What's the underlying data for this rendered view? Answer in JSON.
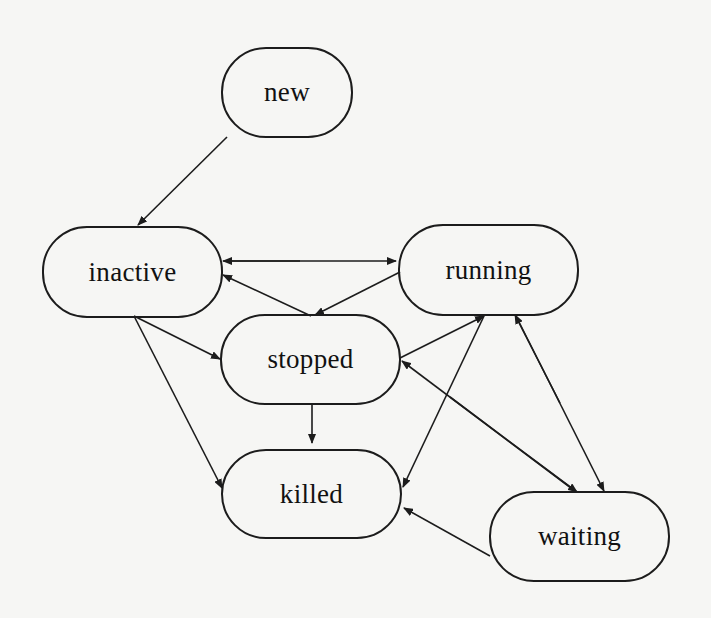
{
  "diagram": {
    "type": "state-transition-diagram",
    "nodes": [
      {
        "id": "new",
        "label": "new"
      },
      {
        "id": "inactive",
        "label": "inactive"
      },
      {
        "id": "running",
        "label": "running"
      },
      {
        "id": "stopped",
        "label": "stopped"
      },
      {
        "id": "killed",
        "label": "killed"
      },
      {
        "id": "waiting",
        "label": "waiting"
      }
    ],
    "edges": [
      {
        "from": "new",
        "to": "inactive"
      },
      {
        "from": "inactive",
        "to": "running"
      },
      {
        "from": "running",
        "to": "inactive"
      },
      {
        "from": "stopped",
        "to": "inactive"
      },
      {
        "from": "inactive",
        "to": "stopped"
      },
      {
        "from": "inactive",
        "to": "killed"
      },
      {
        "from": "running",
        "to": "stopped"
      },
      {
        "from": "stopped",
        "to": "running"
      },
      {
        "from": "stopped",
        "to": "killed"
      },
      {
        "from": "running",
        "to": "killed"
      },
      {
        "from": "running",
        "to": "waiting"
      },
      {
        "from": "waiting",
        "to": "running"
      },
      {
        "from": "waiting",
        "to": "stopped"
      },
      {
        "from": "waiting",
        "to": "killed"
      }
    ],
    "colors": {
      "stroke": "#1c1c1c",
      "text": "#111111",
      "background": "#f6f6f4"
    }
  }
}
